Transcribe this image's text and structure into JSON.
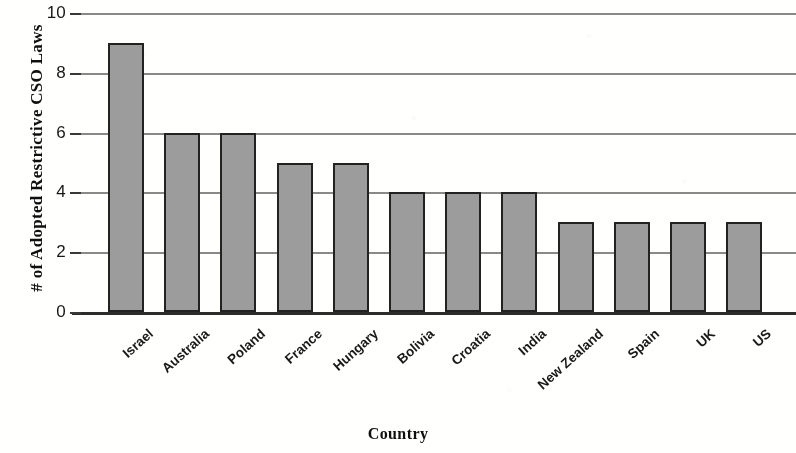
{
  "chart_data": {
    "type": "bar",
    "title": "",
    "xlabel": "Country",
    "ylabel": "# of Adopted Restrictive CSO Laws",
    "categories": [
      "Israel",
      "Australia",
      "Poland",
      "France",
      "Hungary",
      "Bolivia",
      "Croatia",
      "India",
      "New Zealand",
      "Spain",
      "UK",
      "US"
    ],
    "values": [
      9,
      6,
      6,
      5,
      5,
      4,
      4,
      4,
      3,
      3,
      3,
      3
    ],
    "ylim": [
      0,
      10
    ],
    "yticks": [
      0,
      2,
      4,
      6,
      8,
      10
    ],
    "ytick_labels": [
      "0",
      "2",
      "4",
      "6",
      "8",
      "10"
    ],
    "grid": true,
    "grid_axis": "y",
    "legend": false,
    "legend_position": "none",
    "series": [
      {
        "name": "# of Adopted Restrictive CSO Laws",
        "values": [
          9,
          6,
          6,
          5,
          5,
          4,
          4,
          4,
          3,
          3,
          3,
          3
        ]
      }
    ],
    "bar_fill_color": "#9b9b9b",
    "bar_edge_color": "#242424",
    "gridline_color": "#6f6f6f",
    "axis_color": "#2e2e2e",
    "background_color": "#fdfdfc"
  }
}
